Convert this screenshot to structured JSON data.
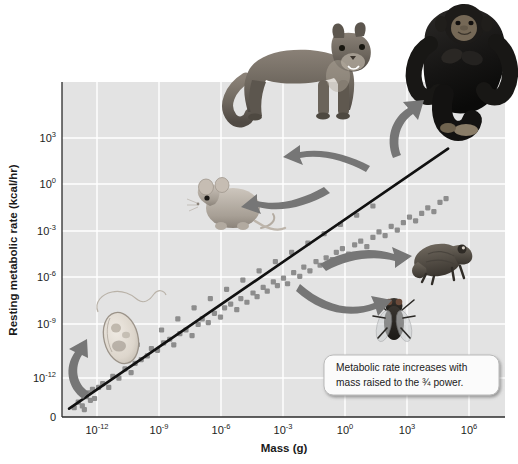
{
  "figure": {
    "name": "metabolic-scaling-plot",
    "background_color": "#ffffff",
    "plot_background_color": "#e3e3e3",
    "gridline_color": "#ffffff",
    "line_color": "#111111",
    "point_color": "#8d8d8d",
    "arrow_color": "#6f6f6f"
  },
  "axes": {
    "y_axis_label": "Resting metabolic rate (kcal/hr)",
    "x_axis_label": "Mass (g)",
    "y_ticks": [
      {
        "base": "10",
        "exp": "3",
        "zero": false
      },
      {
        "base": "10",
        "exp": "0",
        "zero": false
      },
      {
        "base": "10",
        "exp": "-3",
        "zero": false
      },
      {
        "base": "10",
        "exp": "-6",
        "zero": false
      },
      {
        "base": "10",
        "exp": "-9",
        "zero": false
      },
      {
        "base": "10",
        "exp": "-12",
        "zero": false
      },
      {
        "base": "0",
        "exp": "",
        "zero": true
      }
    ],
    "x_ticks": [
      {
        "base": "10",
        "exp": "-12"
      },
      {
        "base": "10",
        "exp": "-9"
      },
      {
        "base": "10",
        "exp": "-6"
      },
      {
        "base": "10",
        "exp": "-3"
      },
      {
        "base": "10",
        "exp": "0"
      },
      {
        "base": "10",
        "exp": "3"
      },
      {
        "base": "10",
        "exp": "6"
      }
    ]
  },
  "callout": {
    "line1": "Metabolic rate increases with",
    "line2": "mass raised to the ¾ power."
  },
  "organisms": [
    {
      "name": "protozoan",
      "label": "protozoan"
    },
    {
      "name": "fly",
      "label": "fly"
    },
    {
      "name": "mouse",
      "label": "mouse"
    },
    {
      "name": "frog",
      "label": "frog"
    },
    {
      "name": "cougar",
      "label": "cougar"
    },
    {
      "name": "chimpanzee",
      "label": "chimpanzee"
    }
  ],
  "chart_data": {
    "type": "scatter",
    "title": "",
    "xlabel": "Mass (g)",
    "ylabel": "Resting metabolic rate (kcal/hr)",
    "x_scale": "log10",
    "y_scale": "log10",
    "xlim": [
      -13.9,
      7.9
    ],
    "ylim": [
      -13.5,
      4.6
    ],
    "x_tick_values": [
      -12,
      -9,
      -6,
      -3,
      0,
      3,
      6
    ],
    "y_tick_values": [
      3,
      0,
      -3,
      -6,
      -9,
      -12
    ],
    "grid": true,
    "legend": null,
    "annotations": [
      {
        "text": "Metabolic rate increases with mass raised to the ¾ power.",
        "x": 3.5,
        "y": -11.0
      }
    ],
    "fit_line": {
      "label": "allometric scaling, slope = 3/4",
      "slope": 0.75,
      "x_start": -13.55,
      "y_start": -13.05,
      "x_end": 5.1,
      "y_end": 1.0
    },
    "series": [
      {
        "name": "organisms",
        "marker": "square",
        "points": [
          [
            -13.3,
            -13.0
          ],
          [
            -13.1,
            -12.7
          ],
          [
            -12.9,
            -12.9
          ],
          [
            -12.7,
            -12.4
          ],
          [
            -12.8,
            -13.1
          ],
          [
            -12.5,
            -12.6
          ],
          [
            -12.6,
            -12.2
          ],
          [
            -12.3,
            -12.5
          ],
          [
            -12.1,
            -11.9
          ],
          [
            -12.4,
            -12.0
          ],
          [
            -11.9,
            -11.7
          ],
          [
            -11.6,
            -11.9
          ],
          [
            -11.4,
            -11.3
          ],
          [
            -11.1,
            -11.4
          ],
          [
            -10.8,
            -10.9
          ],
          [
            -10.5,
            -11.1
          ],
          [
            -10.3,
            -10.6
          ],
          [
            -10.0,
            -10.4
          ],
          [
            -9.7,
            -10.2
          ],
          [
            -9.5,
            -9.8
          ],
          [
            -9.2,
            -9.9
          ],
          [
            -8.9,
            -9.5
          ],
          [
            -8.6,
            -9.3
          ],
          [
            -8.4,
            -9.6
          ],
          [
            -8.1,
            -9.0
          ],
          [
            -7.8,
            -8.8
          ],
          [
            -7.5,
            -9.1
          ],
          [
            -7.2,
            -8.5
          ],
          [
            -7.0,
            -8.2
          ],
          [
            -6.7,
            -8.4
          ],
          [
            -6.4,
            -7.9
          ],
          [
            -6.1,
            -8.1
          ],
          [
            -5.9,
            -7.6
          ],
          [
            -5.6,
            -7.4
          ],
          [
            -5.3,
            -7.7
          ],
          [
            -5.1,
            -7.1
          ],
          [
            -4.8,
            -7.3
          ],
          [
            -4.5,
            -6.8
          ],
          [
            -4.3,
            -7.0
          ],
          [
            -4.0,
            -6.5
          ],
          [
            -3.8,
            -6.7
          ],
          [
            -3.5,
            -6.2
          ],
          [
            -3.3,
            -6.4
          ],
          [
            -3.0,
            -6.0
          ],
          [
            -2.8,
            -6.3
          ],
          [
            -2.5,
            -5.7
          ],
          [
            -2.2,
            -5.9
          ],
          [
            -2.0,
            -5.4
          ],
          [
            -1.7,
            -5.6
          ],
          [
            -1.4,
            -5.1
          ],
          [
            -1.2,
            -5.3
          ],
          [
            -0.9,
            -4.9
          ],
          [
            -0.6,
            -5.0
          ],
          [
            -0.4,
            -4.6
          ],
          [
            -0.1,
            -4.4
          ],
          [
            0.2,
            -4.7
          ],
          [
            0.5,
            -4.2
          ],
          [
            0.8,
            -4.0
          ],
          [
            1.1,
            -4.3
          ],
          [
            1.4,
            -3.8
          ],
          [
            1.7,
            -3.5
          ],
          [
            2.0,
            -3.7
          ],
          [
            2.3,
            -3.2
          ],
          [
            2.6,
            -3.4
          ],
          [
            2.9,
            -3.0
          ],
          [
            3.2,
            -2.7
          ],
          [
            3.5,
            -2.9
          ],
          [
            3.8,
            -2.5
          ],
          [
            4.1,
            -2.2
          ],
          [
            4.4,
            -2.4
          ],
          [
            4.7,
            -1.9
          ],
          [
            5.0,
            -1.7
          ],
          [
            -10.9,
            -10.2
          ],
          [
            -10.2,
            -9.6
          ],
          [
            -9.0,
            -8.8
          ],
          [
            -8.2,
            -8.2
          ],
          [
            -7.4,
            -7.6
          ],
          [
            -6.6,
            -7.1
          ],
          [
            -5.8,
            -6.6
          ],
          [
            -5.0,
            -6.1
          ],
          [
            -4.2,
            -5.6
          ],
          [
            -3.4,
            -5.1
          ],
          [
            -2.6,
            -4.6
          ],
          [
            -1.8,
            -4.1
          ],
          [
            -1.0,
            -3.6
          ],
          [
            -0.2,
            -3.1
          ],
          [
            0.6,
            -2.6
          ],
          [
            1.4,
            -2.1
          ]
        ]
      }
    ]
  }
}
